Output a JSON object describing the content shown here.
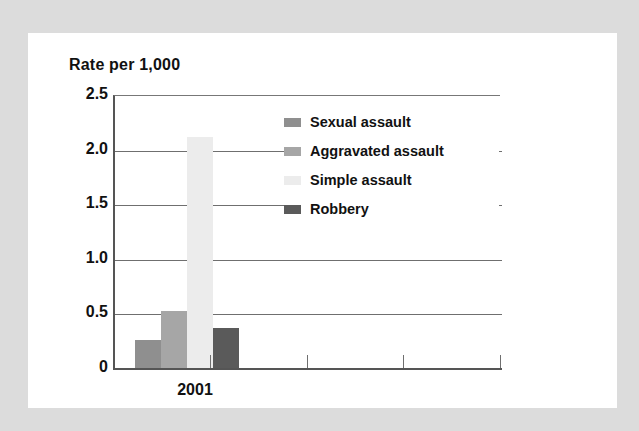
{
  "chart_data": {
    "type": "bar",
    "title": "Rate per 1,000",
    "xlabel": "",
    "ylabel": "Rate per 1,000",
    "categories": [
      "2001"
    ],
    "series": [
      {
        "name": "Sexual assault",
        "values": [
          0.26
        ],
        "color": "#8f8f8f"
      },
      {
        "name": "Aggravated assault",
        "values": [
          0.52
        ],
        "color": "#a6a6a6"
      },
      {
        "name": "Simple assault",
        "values": [
          2.12
        ],
        "color": "#ececec"
      },
      {
        "name": "Robbery",
        "values": [
          0.37
        ],
        "color": "#5a5a5a"
      }
    ],
    "ylim": [
      0,
      2.5
    ],
    "ytick_labels": [
      "2.5",
      "2.0",
      "1.5",
      "1.0",
      "0.5",
      "0"
    ],
    "ytick_values": [
      2.5,
      2.0,
      1.5,
      1.0,
      0.5,
      0
    ],
    "grid": true,
    "legend_position": "inside-upper-right",
    "x_axis_ticks": 4
  },
  "legend": {
    "items": [
      {
        "label": "Sexual assault",
        "swatch_color": "#8f8f8f"
      },
      {
        "label": "Aggravated assault",
        "swatch_color": "#a6a6a6"
      },
      {
        "label": "Simple assault",
        "swatch_color": "#ececec"
      },
      {
        "label": "Robbery",
        "swatch_color": "#5a5a5a"
      }
    ]
  },
  "axis": {
    "y_labels": [
      "2.5",
      "2.0",
      "1.5",
      "1.0",
      "0.5",
      "0"
    ],
    "x_category_label": "2001"
  },
  "colors": {
    "page_background": "#ffffff",
    "scan_border": "#dcdcdc",
    "text": "#111111",
    "gridline": "#6f6f6f",
    "axis": "#555555"
  }
}
